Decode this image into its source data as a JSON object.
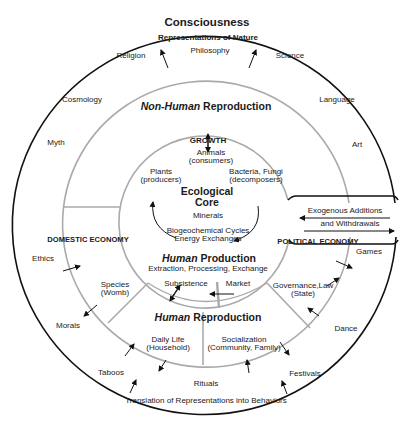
{
  "outer_ring": {
    "title": "Consciousness",
    "subtitle": "Representations of Nature",
    "top_items": [
      "Religion",
      "Philosophy",
      "Science"
    ],
    "left_items": [
      "Cosmology",
      "Myth",
      "Ethics",
      "Morals",
      "Taboos"
    ],
    "right_items": [
      "Language",
      "Art",
      "Games",
      "Dance",
      "Festivals"
    ],
    "bottom_items": [
      "Rituals"
    ],
    "bottom_caption": "Translation of Representations into Behaviors"
  },
  "middle_ring": {
    "top_title_italic": "Non-Human",
    "top_title_rest": "Reproduction",
    "left_sector": "DOMESTIC ECONOMY",
    "right_sector": "POLITICAL ECONOMY",
    "domestic_item": {
      "line1": "Species",
      "line2": "(Womb)"
    },
    "political_item": {
      "line1": "Governance,Law",
      "line2": "(State)"
    },
    "bottom_title_italic": "Human",
    "bottom_title_rest": "Reproduction",
    "daily_life": {
      "line1": "Daily Life",
      "line2": "(Household)"
    },
    "socialization": {
      "line1": "Socialization",
      "line2": "(Community, Family)"
    }
  },
  "core": {
    "growth": "GROWTH",
    "animals": {
      "line1": "Animals",
      "line2": "(consumers)"
    },
    "plants": {
      "line1": "Plants",
      "line2": "(producers)"
    },
    "bacteria": {
      "line1": "Bacteria, Fungi",
      "line2": "(decomposers)"
    },
    "title_line1": "Ecological",
    "title_line2": "Core",
    "minerals": "Minerals",
    "cycles_line1": "Biogeochemical Cycles",
    "cycles_line2": "Energy Exchanges",
    "production_italic": "Human",
    "production_rest": "Production",
    "production_sub": "Extraction, Processing, Exchange",
    "subsistence": "Subsistence",
    "market": "Market"
  },
  "exogenous": {
    "line1": "Exogenous Additions",
    "line2": "and Withdrawals"
  },
  "colors": {
    "outer_line": "#111111",
    "ring_line": "#a8a8a8",
    "text": "#1a1a1a"
  }
}
